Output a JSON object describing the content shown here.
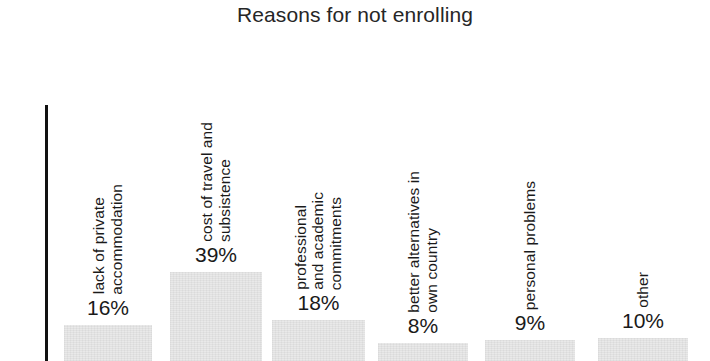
{
  "chart_data": {
    "type": "bar",
    "title": "Reasons for not enrolling",
    "xlabel": "",
    "ylabel": "",
    "ylim": [
      0,
      45
    ],
    "grid": false,
    "legend": null,
    "value_suffix": "%",
    "categories": [
      "lack of private accommodation",
      "cost of travel and subsistence",
      "professional and academic commitments",
      "better alternatives in own country",
      "personal problems",
      "other"
    ],
    "values": [
      16,
      39,
      18,
      8,
      9,
      10
    ],
    "value_labels": [
      "16%",
      "39%",
      "18%",
      "8%",
      "9%",
      "10%"
    ],
    "category_label_lines": [
      [
        "lack of private",
        "accommodation"
      ],
      [
        "cost of travel and",
        "subsistence"
      ],
      [
        "professional",
        "and academic",
        "commitments"
      ],
      [
        "better alternatives in",
        "own country"
      ],
      [
        "personal problems"
      ],
      [
        "other"
      ]
    ],
    "colors": {
      "bar_fill": "#e9e9e9",
      "axis": "#111111",
      "text": "#1a1a1a",
      "background": "#ffffff"
    }
  }
}
